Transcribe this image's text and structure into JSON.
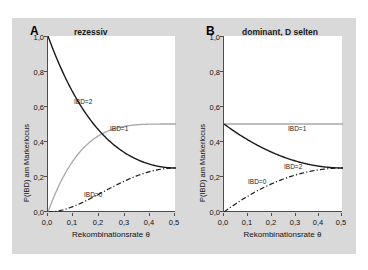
{
  "figure": {
    "background_color": "#d9d9d9",
    "plot_background_color": "#ffffff"
  },
  "panels": [
    {
      "letter": "A",
      "title": "rezessiv",
      "xlabel": "Rekombinationsrate θ",
      "ylabel": "P(IBD) am Markerlocus",
      "xticks": [
        "0,0",
        "0,1",
        "0,2",
        "0,3",
        "0,4",
        "0,5"
      ],
      "yticks": [
        "0,0",
        "0,2",
        "0,4",
        "0,6",
        "0,8",
        "1,0"
      ],
      "curve_labels": [
        {
          "text": "IBD=2"
        },
        {
          "text": "IBD=1"
        },
        {
          "text": "IBD=0"
        }
      ]
    },
    {
      "letter": "B",
      "title": "dominant, D selten",
      "xlabel": "Rekombinationsrate θ",
      "ylabel": "P(IBD) am Markerlocus",
      "xticks": [
        "0,0",
        "0,1",
        "0,2",
        "0,3",
        "0,4",
        "0,5"
      ],
      "yticks": [
        "0,0",
        "0,2",
        "0,4",
        "0,6",
        "0,8",
        "1,0"
      ],
      "curve_labels": [
        {
          "text": "IBD=1"
        },
        {
          "text": "IBD=2"
        },
        {
          "text": "IBD=0"
        }
      ]
    }
  ],
  "chart_data": [
    {
      "type": "line",
      "title": "rezessiv",
      "panel": "A",
      "xlabel": "Rekombinationsrate θ",
      "ylabel": "P(IBD) am Markerlocus",
      "xlim": [
        0.0,
        0.5
      ],
      "ylim": [
        0.0,
        1.0
      ],
      "xticks": [
        0.0,
        0.1,
        0.2,
        0.3,
        0.4,
        0.5
      ],
      "yticks": [
        0.0,
        0.2,
        0.4,
        0.6,
        0.8,
        1.0
      ],
      "grid": false,
      "legend": "inline-curve-labels",
      "x": [
        0.0,
        0.05,
        0.1,
        0.15,
        0.2,
        0.25,
        0.3,
        0.35,
        0.4,
        0.45,
        0.5
      ],
      "series": [
        {
          "name": "IBD=2",
          "style": "solid",
          "color": "#1a1a1a",
          "values": [
            1.0,
            0.815,
            0.669,
            0.555,
            0.467,
            0.4,
            0.35,
            0.315,
            0.289,
            0.272,
            0.25
          ]
        },
        {
          "name": "IBD=1",
          "style": "solid-light",
          "color": "#a8a8a8",
          "values": [
            0.0,
            0.171,
            0.288,
            0.368,
            0.421,
            0.455,
            0.476,
            0.489,
            0.496,
            0.499,
            0.5
          ]
        },
        {
          "name": "IBD=0",
          "style": "dash-dot",
          "color": "#1a1a1a",
          "values": [
            0.0,
            0.009,
            0.034,
            0.072,
            0.119,
            0.17,
            0.22,
            0.266,
            0.303,
            0.329,
            0.25
          ]
        }
      ]
    },
    {
      "type": "line",
      "title": "dominant, D selten",
      "panel": "B",
      "xlabel": "Rekombinationsrate θ",
      "ylabel": "P(IBD) am Markerlocus",
      "xlim": [
        0.0,
        0.5
      ],
      "ylim": [
        0.0,
        1.0
      ],
      "xticks": [
        0.0,
        0.1,
        0.2,
        0.3,
        0.4,
        0.5
      ],
      "yticks": [
        0.0,
        0.2,
        0.4,
        0.6,
        0.8,
        1.0
      ],
      "grid": false,
      "legend": "inline-curve-labels",
      "x": [
        0.0,
        0.05,
        0.1,
        0.15,
        0.2,
        0.25,
        0.3,
        0.35,
        0.4,
        0.45,
        0.5
      ],
      "series": [
        {
          "name": "IBD=1",
          "style": "solid-light",
          "color": "#a8a8a8",
          "values": [
            0.5,
            0.5,
            0.5,
            0.5,
            0.5,
            0.5,
            0.5,
            0.5,
            0.5,
            0.5,
            0.5
          ]
        },
        {
          "name": "IBD=2",
          "style": "solid",
          "color": "#1a1a1a",
          "values": [
            0.5,
            0.452,
            0.41,
            0.374,
            0.342,
            0.316,
            0.295,
            0.278,
            0.266,
            0.257,
            0.25
          ]
        },
        {
          "name": "IBD=0",
          "style": "dash-dot",
          "color": "#1a1a1a",
          "values": [
            0.0,
            0.048,
            0.09,
            0.126,
            0.158,
            0.184,
            0.205,
            0.222,
            0.234,
            0.243,
            0.25
          ]
        }
      ]
    }
  ]
}
